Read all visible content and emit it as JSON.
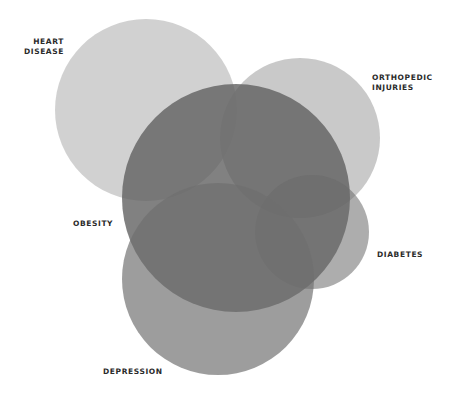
{
  "diagram": {
    "type": "venn",
    "sets": [
      {
        "id": "heart",
        "label": "HEART\nDISEASE",
        "cx": 146,
        "cy": 110,
        "r": 91,
        "color": "#c6c6c6",
        "opacity": 0.7
      },
      {
        "id": "ortho",
        "label": "ORTHOPEDIC\nINJURIES",
        "cx": 300,
        "cy": 138,
        "r": 80,
        "color": "#bdbdbd",
        "opacity": 0.75
      },
      {
        "id": "obesity",
        "label": "OBESITY",
        "cx": 236,
        "cy": 198,
        "r": 114,
        "color": "#6c6c6c",
        "opacity": 0.8
      },
      {
        "id": "diabetes",
        "label": "DIABETES",
        "cx": 312,
        "cy": 232,
        "r": 57,
        "color": "#6a6a6a",
        "opacity": 0.6
      },
      {
        "id": "depression",
        "label": "DEPRESSION",
        "cx": 218,
        "cy": 279,
        "r": 96,
        "color": "#6e6e6e",
        "opacity": 0.7
      }
    ]
  },
  "labels": {
    "heart": "HEART\nDISEASE",
    "ortho": "ORTHOPEDIC\nINJURIES",
    "obesity": "OBESITY",
    "diabetes": "DIABETES",
    "depression": "DEPRESSION"
  }
}
